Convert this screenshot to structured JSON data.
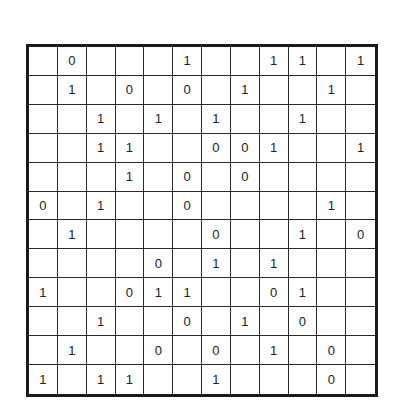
{
  "puzzle": {
    "type": "binary-puzzle",
    "size": 12,
    "grid": [
      [
        "",
        "0",
        "",
        "",
        "",
        "1",
        "",
        "",
        "1",
        "1",
        "",
        "1"
      ],
      [
        "",
        "1",
        "",
        "0",
        "",
        "0",
        "",
        "1",
        "",
        "",
        "1",
        ""
      ],
      [
        "",
        "",
        "1",
        "",
        "1",
        "",
        "1",
        "",
        "",
        "1",
        "",
        ""
      ],
      [
        "",
        "",
        "1",
        "1",
        "",
        "",
        "0",
        "0",
        "1",
        "",
        "",
        "1"
      ],
      [
        "",
        "",
        "",
        "1",
        "",
        "0",
        "",
        "0",
        "",
        "",
        "",
        ""
      ],
      [
        "0",
        "",
        "1",
        "",
        "",
        "0",
        "",
        "",
        "",
        "",
        "1",
        ""
      ],
      [
        "",
        "1",
        "",
        "",
        "",
        "",
        "0",
        "",
        "",
        "1",
        "",
        "0"
      ],
      [
        "",
        "",
        "",
        "",
        "0",
        "",
        "1",
        "",
        "1",
        "",
        "",
        ""
      ],
      [
        "1",
        "",
        "",
        "0",
        "1",
        "1",
        "",
        "",
        "0",
        "1",
        "",
        ""
      ],
      [
        "",
        "",
        "1",
        "",
        "",
        "0",
        "",
        "1",
        "",
        "0",
        "",
        ""
      ],
      [
        "",
        "1",
        "",
        "",
        "0",
        "",
        "0",
        "",
        "1",
        "",
        "0",
        ""
      ],
      [
        "1",
        "",
        "1",
        "1",
        "",
        "",
        "1",
        "",
        "",
        "",
        "0",
        ""
      ]
    ]
  }
}
